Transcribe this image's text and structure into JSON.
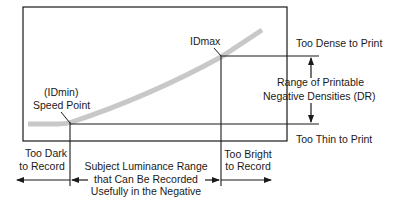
{
  "diagram": {
    "labels": {
      "idmax": "IDmax",
      "idmin_line1": "(IDmin)",
      "idmin_line2": "Speed Point",
      "too_dense": "Too Dense to Print",
      "range_line1": "Range of Printable",
      "range_line2": "Negative Densities (DR)",
      "too_thin": "Too Thin to Print",
      "too_dark_line1": "Too Dark",
      "too_dark_line2": "to Record",
      "luminance_line1": "Subject Luminance Range",
      "luminance_line2": "that Can Be Recorded",
      "luminance_line3": "Usefully in the Negative",
      "too_bright_line1": "Too Bright",
      "too_bright_line2": "to Record"
    },
    "colors": {
      "curve": "#c8c8c8",
      "lines": "#1a1a1a"
    }
  }
}
